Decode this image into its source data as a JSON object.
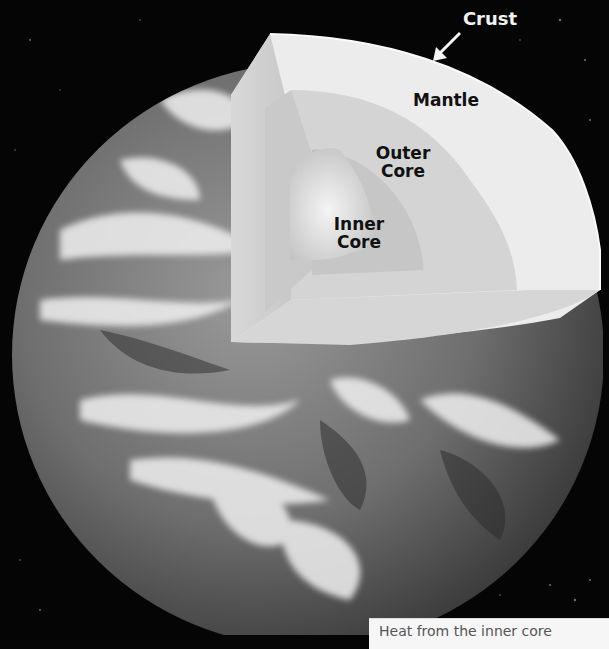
{
  "diagram": {
    "background_color": "#050505",
    "layers": [
      {
        "key": "crust",
        "label": "Crust",
        "color": "#f5f5f5"
      },
      {
        "key": "mantle",
        "label": "Mantle",
        "color": "#dcdcdc"
      },
      {
        "key": "outer_core",
        "label": "Outer\nCore",
        "line1": "Outer",
        "line2": "Core",
        "color": "#c6c6c6"
      },
      {
        "key": "inner_core",
        "label": "Inner\nCore",
        "line1": "Inner",
        "line2": "Core",
        "color": "#e4e4e4"
      }
    ],
    "crust_arrow": "arrow pointing down-left to crust edge"
  },
  "caption": {
    "text": "Heat from the inner core"
  }
}
